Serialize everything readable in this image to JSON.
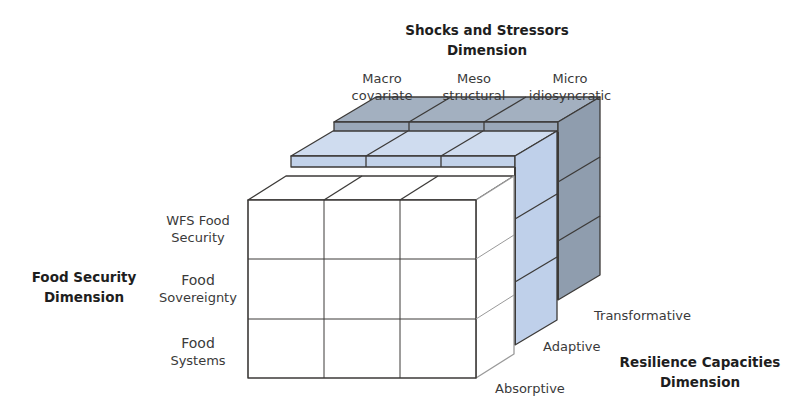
{
  "diagram": {
    "type": "3d-cube-framework",
    "colors": {
      "front_layer": "#ffffff",
      "middle_layer": "#c6d6ee",
      "back_layer": "#97a5b6",
      "edges": "#3c3a38"
    },
    "shocks_dimension": {
      "title_line1": "Shocks and Stressors",
      "title_line2": "Dimension",
      "columns": [
        {
          "line1": "Macro",
          "line2": "covariate"
        },
        {
          "line1": "Meso",
          "line2": "structural"
        },
        {
          "line1": "Micro",
          "line2": "idiosyncratic"
        }
      ]
    },
    "food_security_dimension": {
      "title_line1": "Food Security",
      "title_line2": "Dimension",
      "rows": [
        {
          "line1": "WFS Food",
          "line2": "Security"
        },
        {
          "line1": "Food",
          "line2": "Sovereignty"
        },
        {
          "line1": "Food",
          "line2": "Systems"
        }
      ]
    },
    "resilience_dimension": {
      "title_line1": "Resilience Capacities",
      "title_line2": "Dimension",
      "layers": [
        "Absorptive",
        "Adaptive",
        "Transformative"
      ]
    }
  }
}
